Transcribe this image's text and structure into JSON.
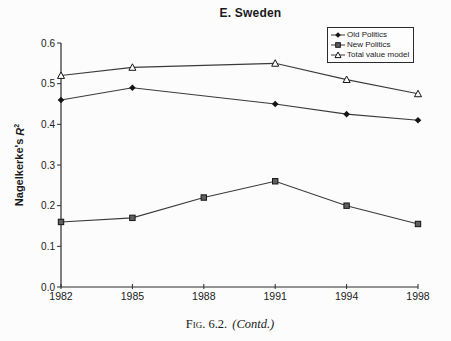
{
  "title": "E. Sweden",
  "y_axis_label": {
    "text": "Nagelkerke's",
    "var": "R",
    "sup": "2"
  },
  "legend": {
    "position": "top-right",
    "items": [
      {
        "label": "Old Politics",
        "marker": "diamond"
      },
      {
        "label": "New Politics",
        "marker": "square"
      },
      {
        "label": "Total value model",
        "marker": "triangle"
      }
    ]
  },
  "caption": {
    "fig_label": "Fig. 6.2.",
    "contd": "(Contd.)"
  },
  "colors": {
    "line": "#3a3a3a",
    "axis": "#2b2b2b",
    "text": "#1a1a1a",
    "diamond_fill": "#151515",
    "square_fill": "#5f5f5f",
    "triangle_fill": "#ffffff",
    "background": "#fcfcfc"
  },
  "chart_data": {
    "type": "line",
    "title": "E. Sweden",
    "xlabel": "",
    "ylabel": "Nagelkerke's R²",
    "categories": [
      "1982",
      "1985",
      "1988",
      "1991",
      "1994",
      "1998"
    ],
    "series": [
      {
        "name": "Old Politics",
        "marker": "diamond",
        "values": [
          0.46,
          0.49,
          null,
          0.45,
          0.425,
          0.41
        ]
      },
      {
        "name": "New Politics",
        "marker": "square",
        "values": [
          0.16,
          0.17,
          0.22,
          0.26,
          0.2,
          0.155
        ]
      },
      {
        "name": "Total value model",
        "marker": "triangle",
        "values": [
          0.52,
          0.54,
          null,
          0.55,
          0.51,
          0.475
        ]
      }
    ],
    "ylim": [
      0.0,
      0.6
    ],
    "yticks": [
      "0.0",
      "0.1",
      "0.2",
      "0.3",
      "0.4",
      "0.5",
      "0.6"
    ],
    "grid": false,
    "legend_position": "top-right",
    "note": "Old Politics and Total value model have no data point at 1988; lines connect 1985 to 1991 directly."
  }
}
